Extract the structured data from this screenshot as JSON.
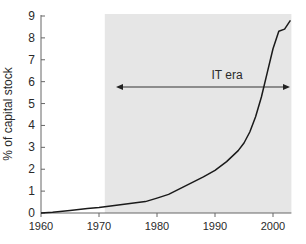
{
  "chart_data": {
    "type": "line",
    "title": "",
    "xlabel": "",
    "ylabel": "% of capital stock",
    "xlim": [
      1960,
      2003
    ],
    "ylim": [
      0,
      9
    ],
    "xticks": [
      1960,
      1970,
      1980,
      1990,
      2000
    ],
    "yticks": [
      0,
      1,
      2,
      3,
      4,
      5,
      6,
      7,
      8,
      9
    ],
    "grid": false,
    "legend": null,
    "shaded_region": {
      "x_start": 1971,
      "x_end": 2003,
      "color": "#e6e6e6"
    },
    "annotation": {
      "text": "IT era",
      "arrow_from": 1973,
      "arrow_to": 2003,
      "y": 5.8,
      "double_headed": true
    },
    "series": [
      {
        "name": "IT share of capital stock",
        "color": "#1a1a1a",
        "x": [
          1960,
          1962,
          1965,
          1968,
          1970,
          1972,
          1975,
          1978,
          1980,
          1982,
          1985,
          1988,
          1990,
          1992,
          1994,
          1995,
          1996,
          1997,
          1998,
          1999,
          2000,
          2001,
          2002,
          2003
        ],
        "values": [
          0.0,
          0.03,
          0.12,
          0.2,
          0.25,
          0.32,
          0.42,
          0.52,
          0.68,
          0.85,
          1.25,
          1.65,
          1.95,
          2.35,
          2.85,
          3.2,
          3.7,
          4.4,
          5.3,
          6.4,
          7.5,
          8.3,
          8.4,
          8.8
        ]
      }
    ]
  }
}
